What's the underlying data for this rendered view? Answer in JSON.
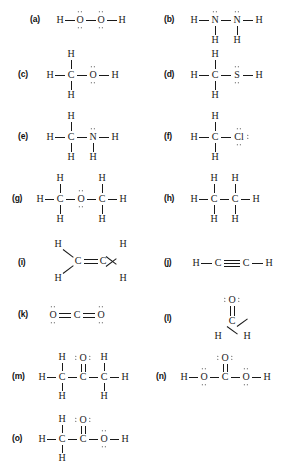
{
  "page": {
    "background_color": "#ffffff",
    "ink_color": "#1a1a1a",
    "width": 288,
    "height": 469
  },
  "structures": [
    {
      "key": "a",
      "label": "(a)",
      "name": "hydrogen-peroxide",
      "formula": "H-O-O-H",
      "atoms": [
        "H",
        "O",
        "O",
        "H"
      ],
      "lone_pairs": "two pairs on each oxygen (above and below)",
      "bonds": "all single"
    },
    {
      "key": "b",
      "label": "(b)",
      "name": "hydrazine",
      "formula": "H2N-NH2",
      "atoms": [
        "H",
        "N",
        "N",
        "H",
        "H",
        "H"
      ],
      "lone_pairs": "one pair above each nitrogen",
      "bonds": "all single"
    },
    {
      "key": "c",
      "label": "(c)",
      "name": "methanol",
      "formula": "CH3-OH",
      "atoms": [
        "H",
        "C",
        "O",
        "H",
        "H",
        "H"
      ],
      "lone_pairs": "two pairs on oxygen (above and below)",
      "bonds": "all single"
    },
    {
      "key": "d",
      "label": "(d)",
      "name": "methanethiol",
      "formula": "CH3-SH",
      "atoms": [
        "H",
        "C",
        "S",
        "H",
        "H",
        "H"
      ],
      "lone_pairs": "two pairs on sulfur (above and below)",
      "bonds": "all single"
    },
    {
      "key": "e",
      "label": "(e)",
      "name": "methylamine",
      "formula": "CH3-NH2",
      "atoms": [
        "H",
        "C",
        "N",
        "H",
        "H",
        "H",
        "H"
      ],
      "lone_pairs": "one pair above nitrogen",
      "bonds": "all single"
    },
    {
      "key": "f",
      "label": "(f)",
      "name": "chloromethane",
      "formula": "CH3-Cl",
      "atoms": [
        "H",
        "C",
        "Cl",
        "H",
        "H"
      ],
      "lone_pairs": "three pairs on chlorine (above, right, below)",
      "bonds": "all single"
    },
    {
      "key": "g",
      "label": "(g)",
      "name": "dimethyl-ether",
      "formula": "CH3-O-CH3",
      "atoms": [
        "H",
        "C",
        "O",
        "C",
        "H",
        "H",
        "H",
        "H",
        "H"
      ],
      "lone_pairs": "two pairs on oxygen (above and below)",
      "bonds": "all single"
    },
    {
      "key": "h",
      "label": "(h)",
      "name": "ethane",
      "formula": "CH3-CH3",
      "atoms": [
        "H",
        "C",
        "C",
        "H",
        "H",
        "H",
        "H",
        "H"
      ],
      "lone_pairs": "none",
      "bonds": "all single"
    },
    {
      "key": "i",
      "label": "(i)",
      "name": "ethylene",
      "formula": "H2C=CH2",
      "atoms": [
        "H",
        "H",
        "C",
        "C",
        "H",
        "H"
      ],
      "lone_pairs": "none",
      "bonds": "C=C double bond, angled C-H single bonds"
    },
    {
      "key": "j",
      "label": "(j)",
      "name": "acetylene",
      "formula": "HC≡CH",
      "atoms": [
        "H",
        "C",
        "C",
        "H"
      ],
      "lone_pairs": "none",
      "bonds": "C≡C triple bond"
    },
    {
      "key": "k",
      "label": "(k)",
      "name": "carbon-dioxide",
      "formula": "O=C=O",
      "atoms": [
        "O",
        "C",
        "O"
      ],
      "lone_pairs": "two pairs on each oxygen (above and below)",
      "bonds": "two C=O double bonds"
    },
    {
      "key": "l",
      "label": "(l)",
      "name": "formaldehyde",
      "formula": "H2C=O",
      "atoms": [
        "O",
        "C",
        "H",
        "H"
      ],
      "lone_pairs": "two pairs on oxygen (left and right)",
      "bonds": "C=O double bond, angled C-H single bonds"
    },
    {
      "key": "m",
      "label": "(m)",
      "name": "acetone",
      "formula": "CH3-CO-CH3",
      "atoms": [
        "H",
        "C",
        "C",
        "C",
        "H",
        "O",
        "H",
        "H",
        "H",
        "H"
      ],
      "lone_pairs": "two pairs on oxygen (left and right)",
      "bonds": "C=O double bond, rest single"
    },
    {
      "key": "n",
      "label": "(n)",
      "name": "carbonic-acid",
      "formula": "HO-CO-OH",
      "atoms": [
        "H",
        "O",
        "C",
        "O",
        "H",
        "O"
      ],
      "lone_pairs": "two pairs on each hydroxyl oxygen, two pairs on carbonyl oxygen",
      "bonds": "C=O double bond, rest single"
    },
    {
      "key": "o",
      "label": "(o)",
      "name": "acetic-acid",
      "formula": "CH3-COOH",
      "atoms": [
        "H",
        "C",
        "C",
        "O",
        "H",
        "O",
        "H",
        "H"
      ],
      "lone_pairs": "two pairs on carbonyl oxygen, two pairs on hydroxyl oxygen",
      "bonds": "C=O double bond, rest single"
    }
  ],
  "glyphs": {
    "H": "H",
    "C": "C",
    "O": "O",
    "N": "N",
    "S": "S",
    "Cl": "Cl"
  }
}
